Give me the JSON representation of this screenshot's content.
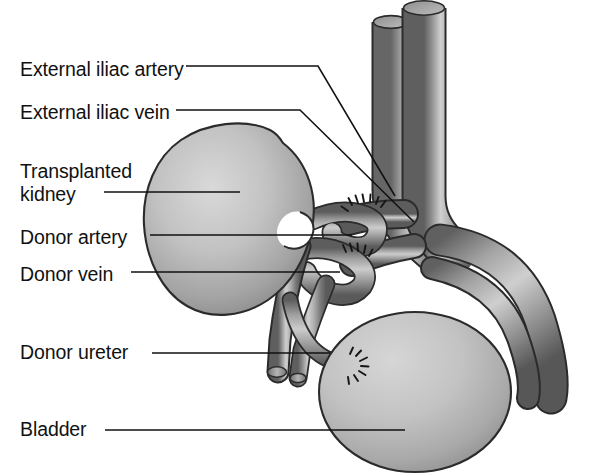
{
  "figure": {
    "background_color": "#ffffff",
    "line_color": "#111111",
    "label_color": "#111111",
    "outline_color": "#2b2b2b",
    "tissue_light": "#d8d8d8",
    "tissue_mid": "#a8a8a8",
    "tissue_dark": "#6e6e6e",
    "tissue_shadow": "#4a4a4a"
  },
  "labels": [
    {
      "id": "external-iliac-artery",
      "text": "External iliac artery",
      "x": 20,
      "y": 58
    },
    {
      "id": "external-iliac-vein",
      "text": "External iliac vein",
      "x": 20,
      "y": 101
    },
    {
      "id": "transplanted-kidney-1",
      "text": "Transplanted",
      "x": 20,
      "y": 160
    },
    {
      "id": "transplanted-kidney-2",
      "text": "kidney",
      "x": 20,
      "y": 183
    },
    {
      "id": "donor-artery",
      "text": "Donor artery",
      "x": 20,
      "y": 226
    },
    {
      "id": "donor-vein",
      "text": "Donor vein",
      "x": 20,
      "y": 263
    },
    {
      "id": "donor-ureter",
      "text": "Donor ureter",
      "x": 20,
      "y": 341
    },
    {
      "id": "bladder",
      "text": "Bladder",
      "x": 20,
      "y": 418
    }
  ],
  "structures": [
    {
      "id": "aorta",
      "name": "aorta (cut)"
    },
    {
      "id": "vena-cava",
      "name": "inferior vena cava (cut)"
    },
    {
      "id": "external-iliac-artery",
      "name": "external iliac artery"
    },
    {
      "id": "external-iliac-vein",
      "name": "external iliac vein"
    },
    {
      "id": "transplanted-kidney",
      "name": "transplanted kidney"
    },
    {
      "id": "donor-artery",
      "name": "donor renal artery"
    },
    {
      "id": "donor-vein",
      "name": "donor renal vein"
    },
    {
      "id": "donor-ureter",
      "name": "donor ureter"
    },
    {
      "id": "bladder",
      "name": "urinary bladder"
    },
    {
      "id": "artery-anastomosis",
      "name": "arterial anastomosis sutures"
    },
    {
      "id": "vein-anastomosis",
      "name": "venous anastomosis sutures"
    },
    {
      "id": "ureter-anastomosis",
      "name": "ureteral anastomosis sutures"
    }
  ],
  "leaders": [
    {
      "id": "leader-external-iliac-artery",
      "from": [
        186,
        66
      ],
      "to": [
        395,
        196
      ]
    },
    {
      "id": "leader-external-iliac-vein",
      "from": [
        176,
        110
      ],
      "to": [
        414,
        222
      ]
    },
    {
      "id": "leader-transplanted-kidney",
      "from": [
        104,
        192
      ],
      "to": [
        240,
        192
      ]
    },
    {
      "id": "leader-donor-artery",
      "from": [
        150,
        235
      ],
      "to": [
        352,
        235
      ]
    },
    {
      "id": "leader-donor-vein",
      "from": [
        131,
        272
      ],
      "to": [
        340,
        272
      ]
    },
    {
      "id": "leader-donor-ureter",
      "from": [
        152,
        353
      ],
      "to": [
        330,
        353
      ]
    },
    {
      "id": "leader-bladder",
      "from": [
        105,
        430
      ],
      "to": [
        405,
        430
      ]
    }
  ]
}
